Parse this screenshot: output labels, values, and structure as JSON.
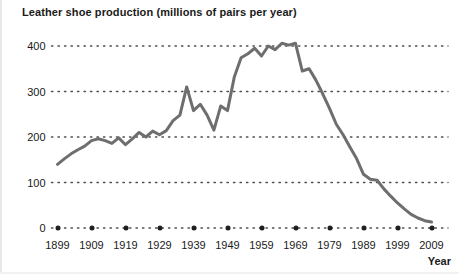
{
  "chart_data": {
    "type": "line",
    "title": "Leather shoe production (millions of pairs per year)",
    "xlabel": "Year",
    "ylabel": "",
    "xlim": [
      1899,
      2009
    ],
    "ylim": [
      0,
      430
    ],
    "grid": true,
    "legend": false,
    "y_ticks": [
      "400",
      "300",
      "200",
      "100",
      "0"
    ],
    "y_tick_values": [
      400,
      300,
      200,
      100,
      0
    ],
    "x_ticks": [
      "1899",
      "1909",
      "1919",
      "1929",
      "1939",
      "1949",
      "1959",
      "1969",
      "1979",
      "1989",
      "1999",
      "2009"
    ],
    "x_tick_values": [
      1899,
      1909,
      1919,
      1929,
      1939,
      1949,
      1959,
      1969,
      1979,
      1989,
      1999,
      2009
    ],
    "line_color": "#6e6e6e",
    "grid_color": "#4d4d4d",
    "x": [
      1899,
      1901,
      1903,
      1905,
      1907,
      1909,
      1911,
      1913,
      1915,
      1917,
      1919,
      1921,
      1923,
      1925,
      1927,
      1929,
      1931,
      1933,
      1935,
      1937,
      1939,
      1941,
      1943,
      1945,
      1947,
      1949,
      1951,
      1953,
      1955,
      1957,
      1959,
      1961,
      1963,
      1965,
      1967,
      1969,
      1971,
      1973,
      1975,
      1977,
      1979,
      1981,
      1983,
      1985,
      1987,
      1989,
      1991,
      1993,
      1995,
      1997,
      1999,
      2001,
      2003,
      2005,
      2007,
      2009
    ],
    "values": [
      140,
      152,
      163,
      172,
      180,
      192,
      196,
      192,
      186,
      198,
      183,
      196,
      210,
      200,
      213,
      205,
      214,
      236,
      248,
      310,
      258,
      272,
      248,
      215,
      268,
      258,
      332,
      374,
      383,
      395,
      378,
      400,
      392,
      406,
      402,
      406,
      345,
      350,
      325,
      295,
      263,
      228,
      205,
      178,
      152,
      118,
      107,
      105,
      86,
      70,
      55,
      42,
      30,
      22,
      16,
      13
    ]
  }
}
